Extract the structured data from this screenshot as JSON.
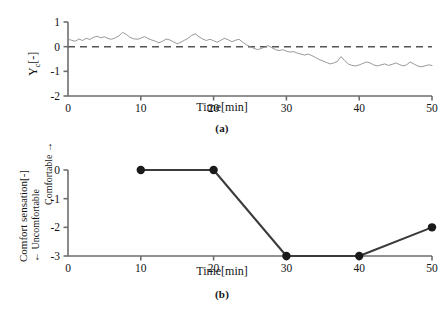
{
  "figure": {
    "background": "#ffffff",
    "trace_color": "#8c8c8c",
    "axis_color": "#6e6e6e",
    "marker_color": "#1a1a1a",
    "line_color_b": "#3a3a3a"
  },
  "panel_a": {
    "caption": "(a)",
    "ylabel_main": "Y",
    "ylabel_sub": "c",
    "ylabel_unit": "[-]",
    "xlabel": "Time[min]",
    "xticks": [
      "0",
      "10",
      "20",
      "30",
      "40",
      "50"
    ],
    "yticks": [
      "1",
      "0",
      "-1",
      "-2"
    ],
    "reference_line_value": "0"
  },
  "panel_b": {
    "caption": "(b)",
    "ylabel_main": "Comfort sensation[-]",
    "ylabel_low": "← Uncomfortable",
    "ylabel_high": "Comfortable →",
    "xlabel": "Time[min]",
    "xticks": [
      "0",
      "10",
      "20",
      "30",
      "40",
      "50"
    ],
    "yticks": [
      "0",
      "-1",
      "-2",
      "-3"
    ]
  },
  "chart_data": [
    {
      "type": "line",
      "panel": "(a)",
      "title": "",
      "xlabel": "Time[min]",
      "ylabel": "Yc[-]",
      "xlim": [
        0,
        50
      ],
      "ylim": [
        -2,
        1
      ],
      "xticks": [
        0,
        10,
        20,
        30,
        40,
        50
      ],
      "yticks": [
        1,
        0,
        -1,
        -2
      ],
      "grid": false,
      "legend": "none",
      "annotations": [
        {
          "type": "hline",
          "y": 0,
          "style": "dashed",
          "label": "zero reference"
        }
      ],
      "series": [
        {
          "name": "Yc",
          "x": [
            0.0,
            0.5,
            1.0,
            1.5,
            2.0,
            2.5,
            3.0,
            3.5,
            4.0,
            4.5,
            5.0,
            5.5,
            6.0,
            6.5,
            7.0,
            7.5,
            8.0,
            8.5,
            9.0,
            9.5,
            10.0,
            10.5,
            11.0,
            11.5,
            12.0,
            12.5,
            13.0,
            13.5,
            14.0,
            14.5,
            15.0,
            15.5,
            16.0,
            16.5,
            17.0,
            17.5,
            18.0,
            18.5,
            19.0,
            19.5,
            20.0,
            20.5,
            21.0,
            21.5,
            22.0,
            22.5,
            23.0,
            23.5,
            24.0,
            24.5,
            25.0,
            25.5,
            26.0,
            26.5,
            27.0,
            27.5,
            28.0,
            28.5,
            29.0,
            29.5,
            30.0,
            30.5,
            31.0,
            31.5,
            32.0,
            32.5,
            33.0,
            33.5,
            34.0,
            34.5,
            35.0,
            35.5,
            36.0,
            36.5,
            37.0,
            37.5,
            38.0,
            38.5,
            39.0,
            39.5,
            40.0,
            40.5,
            41.0,
            41.5,
            42.0,
            42.5,
            43.0,
            43.5,
            44.0,
            44.5,
            45.0,
            45.5,
            46.0,
            46.5,
            47.0,
            47.5,
            48.0,
            48.5,
            49.0,
            49.5,
            50.0
          ],
          "y": [
            0.3,
            0.26,
            0.22,
            0.31,
            0.25,
            0.34,
            0.29,
            0.38,
            0.42,
            0.36,
            0.4,
            0.33,
            0.3,
            0.36,
            0.44,
            0.58,
            0.5,
            0.38,
            0.32,
            0.3,
            0.34,
            0.41,
            0.33,
            0.27,
            0.22,
            0.16,
            0.22,
            0.31,
            0.27,
            0.19,
            0.12,
            0.18,
            0.26,
            0.34,
            0.46,
            0.52,
            0.4,
            0.31,
            0.25,
            0.3,
            0.24,
            0.18,
            0.26,
            0.34,
            0.28,
            0.2,
            0.26,
            0.3,
            0.18,
            0.08,
            0.0,
            -0.06,
            -0.12,
            -0.08,
            -0.02,
            0.04,
            -0.04,
            -0.12,
            -0.16,
            -0.12,
            -0.18,
            -0.22,
            -0.2,
            -0.26,
            -0.3,
            -0.34,
            -0.3,
            -0.36,
            -0.44,
            -0.52,
            -0.58,
            -0.64,
            -0.7,
            -0.66,
            -0.6,
            -0.4,
            -0.56,
            -0.7,
            -0.76,
            -0.78,
            -0.74,
            -0.68,
            -0.62,
            -0.66,
            -0.74,
            -0.78,
            -0.74,
            -0.7,
            -0.76,
            -0.72,
            -0.66,
            -0.72,
            -0.78,
            -0.74,
            -0.62,
            -0.7,
            -0.78,
            -0.82,
            -0.78,
            -0.74,
            -0.76
          ]
        }
      ]
    },
    {
      "type": "line",
      "panel": "(b)",
      "title": "",
      "xlabel": "Time[min]",
      "ylabel": "Comfort sensation[-]",
      "xlim": [
        0,
        50
      ],
      "ylim": [
        -3,
        0
      ],
      "xticks": [
        0,
        10,
        20,
        30,
        40,
        50
      ],
      "yticks": [
        0,
        -1,
        -2,
        -3
      ],
      "grid": false,
      "legend": "none",
      "markers": "filled-circle",
      "series": [
        {
          "name": "Comfort sensation",
          "x": [
            10,
            20,
            30,
            40,
            50
          ],
          "y": [
            0,
            0,
            -3,
            -3,
            -2
          ]
        }
      ]
    }
  ]
}
